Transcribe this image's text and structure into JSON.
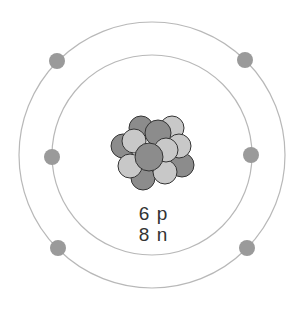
{
  "diagram": {
    "type": "atom-bohr-model",
    "nucleus": {
      "protons_label": "6 p",
      "neutrons_label": "8 n"
    },
    "shells": [
      {
        "name": "inner",
        "electrons": 2
      },
      {
        "name": "outer",
        "electrons": 4
      }
    ],
    "colors": {
      "orbit": "#b0b0b0",
      "electron": "#9a9a9a",
      "proton": "#8c8c8c",
      "neutron": "#c8c8c8",
      "outline": "#333333"
    }
  }
}
